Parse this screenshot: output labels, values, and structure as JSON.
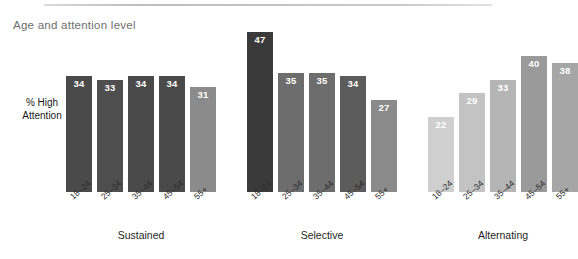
{
  "chart_data": {
    "type": "bar",
    "title": "Age and attention level",
    "ylabel": "% High\nAttention",
    "ylabel_line1": "% High",
    "ylabel_line2": "Attention",
    "xlabel": "",
    "ylim": [
      0,
      50
    ],
    "grid": false,
    "legend": "none",
    "categories": [
      "18–24",
      "25–34",
      "35–44",
      "45–54",
      "55+"
    ],
    "groups": [
      {
        "name": "Sustained",
        "values": [
          34,
          33,
          34,
          34,
          31
        ],
        "colors": [
          "#4a4a4a",
          "#4e4e4e",
          "#4a4a4a",
          "#4a4a4a",
          "#8b8b8b"
        ]
      },
      {
        "name": "Selective",
        "values": [
          47,
          35,
          35,
          34,
          27
        ],
        "colors": [
          "#3a3a3a",
          "#6d6d6d",
          "#6d6d6d",
          "#5c5c5c",
          "#8a8a8a"
        ]
      },
      {
        "name": "Alternating",
        "values": [
          22,
          29,
          33,
          40,
          38
        ],
        "colors": [
          "#cfcfcf",
          "#c3c3c3",
          "#b5b5b5",
          "#9a9a9a",
          "#a6a6a6"
        ]
      }
    ],
    "series": [
      {
        "name": "Sustained",
        "values": [
          34,
          33,
          34,
          34,
          31
        ]
      },
      {
        "name": "Selective",
        "values": [
          47,
          35,
          35,
          34,
          27
        ]
      },
      {
        "name": "Alternating",
        "values": [
          22,
          29,
          33,
          40,
          38
        ]
      }
    ]
  },
  "colors": {
    "background": "#ffffff",
    "title_text": "#6f6f6f",
    "axis_text": "#1f1f1f",
    "value_text": "#ffffff",
    "rule": "#c9c9c9"
  }
}
